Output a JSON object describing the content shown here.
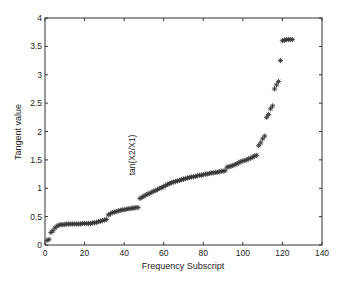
{
  "chart_data": {
    "type": "scatter",
    "title": "",
    "xlabel": "Frequency Subscript",
    "ylabel": "Tangent value",
    "xlim": [
      0,
      140
    ],
    "ylim": [
      0,
      4
    ],
    "xticks": [
      0,
      20,
      40,
      60,
      80,
      100,
      120,
      140
    ],
    "yticks": [
      0,
      0.5,
      1,
      1.5,
      2,
      2.5,
      3,
      3.5,
      4
    ],
    "xtick_labels": [
      "0",
      "20",
      "40",
      "60",
      "80",
      "100",
      "120",
      "140"
    ],
    "ytick_labels": [
      "0",
      "0.5",
      "1",
      "1.5",
      "2",
      "2.5",
      "3",
      "3.5",
      "4"
    ],
    "grid": false,
    "legend": null,
    "marker": "*",
    "marker_color": "#333333",
    "annotations": [
      {
        "text": "tan(X2/X1)",
        "x": 44,
        "y": 0.9,
        "rotation": -90
      }
    ],
    "series": [
      {
        "name": "tan(X2/X1)",
        "x": [
          1,
          2,
          3,
          4,
          5,
          6,
          7,
          8,
          9,
          10,
          11,
          12,
          13,
          14,
          15,
          16,
          17,
          18,
          19,
          20,
          21,
          22,
          23,
          24,
          25,
          26,
          27,
          28,
          29,
          30,
          31,
          32,
          33,
          34,
          35,
          36,
          37,
          38,
          39,
          40,
          41,
          42,
          43,
          44,
          45,
          46,
          47,
          48,
          49,
          50,
          51,
          52,
          53,
          54,
          55,
          56,
          57,
          58,
          59,
          60,
          61,
          62,
          63,
          64,
          65,
          66,
          67,
          68,
          69,
          70,
          71,
          72,
          73,
          74,
          75,
          76,
          77,
          78,
          79,
          80,
          81,
          82,
          83,
          84,
          85,
          86,
          87,
          88,
          89,
          90,
          91,
          92,
          93,
          94,
          95,
          96,
          97,
          98,
          99,
          100,
          101,
          102,
          103,
          104,
          105,
          106,
          107,
          108,
          109,
          110,
          111,
          112,
          113,
          114,
          115,
          116,
          117,
          118,
          119,
          120,
          121,
          122,
          123,
          124,
          125
        ],
        "values": [
          0.08,
          0.1,
          0.22,
          0.25,
          0.3,
          0.33,
          0.35,
          0.36,
          0.36,
          0.36,
          0.37,
          0.37,
          0.37,
          0.37,
          0.37,
          0.37,
          0.37,
          0.37,
          0.38,
          0.38,
          0.38,
          0.38,
          0.38,
          0.39,
          0.39,
          0.4,
          0.41,
          0.42,
          0.43,
          0.44,
          0.45,
          0.53,
          0.55,
          0.57,
          0.58,
          0.59,
          0.6,
          0.61,
          0.62,
          0.62,
          0.63,
          0.64,
          0.64,
          0.65,
          0.65,
          0.66,
          0.66,
          0.82,
          0.84,
          0.86,
          0.88,
          0.9,
          0.91,
          0.93,
          0.95,
          0.96,
          0.98,
          1.0,
          1.01,
          1.03,
          1.05,
          1.07,
          1.08,
          1.1,
          1.11,
          1.12,
          1.13,
          1.14,
          1.15,
          1.16,
          1.17,
          1.18,
          1.19,
          1.2,
          1.2,
          1.21,
          1.22,
          1.23,
          1.23,
          1.24,
          1.25,
          1.25,
          1.26,
          1.27,
          1.27,
          1.28,
          1.28,
          1.29,
          1.3,
          1.3,
          1.31,
          1.37,
          1.38,
          1.39,
          1.4,
          1.42,
          1.43,
          1.45,
          1.47,
          1.48,
          1.49,
          1.5,
          1.52,
          1.53,
          1.55,
          1.57,
          1.58,
          1.75,
          1.8,
          1.87,
          1.92,
          2.25,
          2.3,
          2.4,
          2.45,
          2.75,
          2.82,
          2.88,
          3.25,
          3.6,
          3.61,
          3.62,
          3.62,
          3.62,
          3.62
        ]
      }
    ]
  }
}
